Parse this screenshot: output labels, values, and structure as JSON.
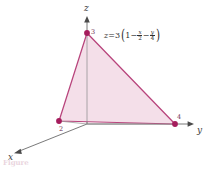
{
  "figure": {
    "type": "3d-plane-triangle-diagram",
    "caption": "Figure",
    "colors": {
      "plane_fill": "#f3dde8",
      "plane_edge": "#b8447c",
      "vertex_dot": "#a51c5c",
      "axis_line": "#6a6a6a",
      "label_text": "#2e2e2e"
    },
    "axes": [
      {
        "name": "x-axis",
        "label": "x"
      },
      {
        "name": "y-axis",
        "label": "y"
      },
      {
        "name": "z-axis",
        "label": "z"
      }
    ],
    "equation": {
      "lhs": "z",
      "equals": "=",
      "coefficient": "3",
      "open_paren": "(",
      "one": "1",
      "minus_1": "−",
      "term1_num": "x",
      "term1_den": "2",
      "minus_2": "−",
      "term2_num": "y",
      "term2_den": "4",
      "close_paren": ")",
      "plain": "z=3(1−x/2−y/4)"
    },
    "intercepts": [
      {
        "name": "z-intercept",
        "label": "3",
        "axis": "z",
        "value": 3
      },
      {
        "name": "x-intercept",
        "label": "2",
        "axis": "x",
        "value": 2
      },
      {
        "name": "y-intercept",
        "label": "4",
        "axis": "y",
        "value": 4
      }
    ]
  }
}
